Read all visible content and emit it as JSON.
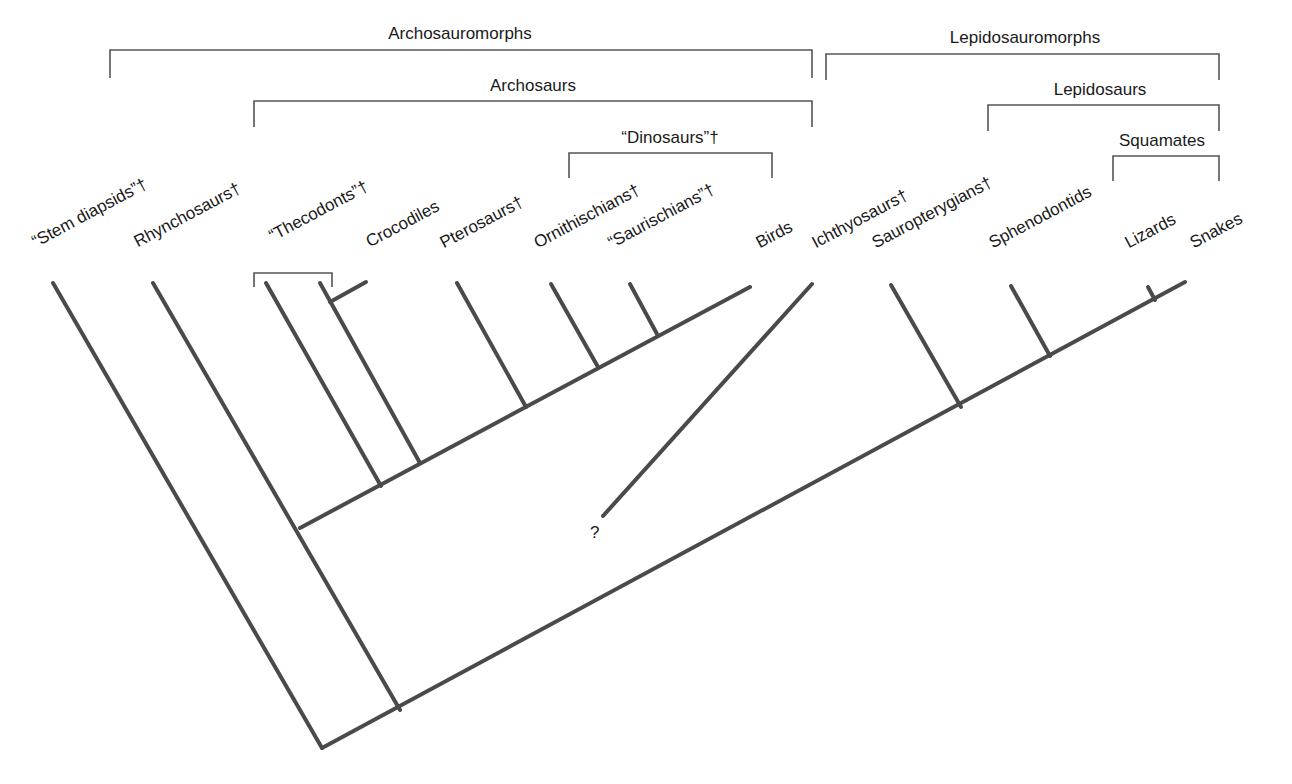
{
  "diagram": {
    "type": "cladogram",
    "clades": [
      {
        "id": "archosauromorphs",
        "label": "Archosauromorphs",
        "x1": 110,
        "x2": 812,
        "y": 50,
        "drop": 28,
        "label_x": 460,
        "label_y": 24
      },
      {
        "id": "archosaurs",
        "label": "Archosaurs",
        "x1": 254,
        "x2": 812,
        "y": 101,
        "drop": 26,
        "label_x": 533,
        "label_y": 76
      },
      {
        "id": "dinosaurs",
        "label": "“Dinosaurs”†",
        "x1": 569,
        "x2": 772,
        "y": 153,
        "drop": 25,
        "label_x": 670,
        "label_y": 128
      },
      {
        "id": "lepidosauromorphs",
        "label": "Lepidosauromorphs",
        "x1": 826,
        "x2": 1219,
        "y": 54,
        "drop": 26,
        "label_x": 1025,
        "label_y": 28
      },
      {
        "id": "lepidosaurs",
        "label": "Lepidosaurs",
        "x1": 988,
        "x2": 1219,
        "y": 105,
        "drop": 26,
        "label_x": 1100,
        "label_y": 80
      },
      {
        "id": "squamates",
        "label": "Squamates",
        "x1": 1113,
        "x2": 1219,
        "y": 156,
        "drop": 25,
        "label_x": 1162,
        "label_y": 131
      },
      {
        "id": "thecodonts-bracket",
        "label": "",
        "x1": 254,
        "x2": 332,
        "y": 273,
        "drop": 14,
        "label_x": 0,
        "label_y": 0
      }
    ],
    "taxa": [
      {
        "id": "stem-diapsids",
        "label": "“Stem diapsids”†",
        "x": 38,
        "y": 252
      },
      {
        "id": "rhynchosaurs",
        "label": "Rhynchosaurs†",
        "x": 140,
        "y": 252
      },
      {
        "id": "thecodonts",
        "label": "“Thecodonts”†",
        "x": 275,
        "y": 246
      },
      {
        "id": "crocodiles",
        "label": "Crocodiles",
        "x": 372,
        "y": 252
      },
      {
        "id": "pterosaurs",
        "label": "Pterosaurs†",
        "x": 446,
        "y": 253
      },
      {
        "id": "ornithischians",
        "label": "Ornithischians†",
        "x": 540,
        "y": 253
      },
      {
        "id": "saurischians",
        "label": "“Saurischians”†",
        "x": 614,
        "y": 253
      },
      {
        "id": "birds",
        "label": "Birds",
        "x": 762,
        "y": 253
      },
      {
        "id": "ichthyosaurs",
        "label": "Ichthyosaurs†",
        "x": 818,
        "y": 253
      },
      {
        "id": "sauropterygians",
        "label": "Sauropterygians†",
        "x": 878,
        "y": 253
      },
      {
        "id": "sphenodontids",
        "label": "Sphenodontids",
        "x": 995,
        "y": 253
      },
      {
        "id": "lizards",
        "label": "Lizards",
        "x": 1131,
        "y": 253
      },
      {
        "id": "snakes",
        "label": "Snakes",
        "x": 1196,
        "y": 253
      }
    ],
    "branches": [
      {
        "id": "main-lepidosauromorph-line",
        "x1": 322,
        "y1": 748,
        "x2": 1185,
        "y2": 282
      },
      {
        "id": "stem-diapsids-branch",
        "x1": 53,
        "y1": 283,
        "x2": 322,
        "y2": 748
      },
      {
        "id": "rhynchosaurs-branch",
        "x1": 153,
        "y1": 283,
        "x2": 400,
        "y2": 710
      },
      {
        "id": "archosaur-line",
        "x1": 300,
        "y1": 528,
        "x2": 750,
        "y2": 287
      },
      {
        "id": "thecodont-branch-1",
        "x1": 266,
        "y1": 283,
        "x2": 381,
        "y2": 486
      },
      {
        "id": "thecodont-crocodile-branch",
        "x1": 320,
        "y1": 283,
        "x2": 420,
        "y2": 463
      },
      {
        "id": "crocodiles-branch",
        "x1": 330,
        "y1": 302,
        "x2": 366,
        "y2": 282
      },
      {
        "id": "pterosaurs-branch",
        "x1": 457,
        "y1": 283,
        "x2": 526,
        "y2": 407
      },
      {
        "id": "ornithischians-branch",
        "x1": 551,
        "y1": 284,
        "x2": 598,
        "y2": 367
      },
      {
        "id": "saurischians-branch",
        "x1": 630,
        "y1": 284,
        "x2": 657,
        "y2": 334
      },
      {
        "id": "sauropterygians-branch",
        "x1": 891,
        "y1": 285,
        "x2": 961,
        "y2": 407
      },
      {
        "id": "sphenodontids-branch",
        "x1": 1011,
        "y1": 286,
        "x2": 1050,
        "y2": 356
      },
      {
        "id": "lizards-branch",
        "x1": 1148,
        "y1": 287,
        "x2": 1155,
        "y2": 300
      }
    ],
    "uncertain_branches": [
      {
        "id": "ichthyosaurs-branch",
        "x1": 812,
        "y1": 284,
        "x2": 603,
        "y2": 516
      }
    ],
    "uncertain_marker": {
      "label": "?",
      "x": 590,
      "y": 523
    },
    "colors": {
      "branch": "#4a4a4a",
      "bracket": "#555555",
      "text": "#1a1a1a",
      "background": "#ffffff"
    }
  }
}
